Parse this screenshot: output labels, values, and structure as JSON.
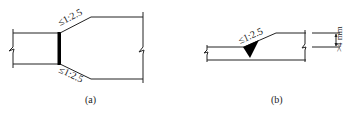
{
  "figures": [
    {
      "id": "a",
      "caption": "(a)",
      "slope_top": "≤1:2.5",
      "slope_bottom": "≤1:2.5"
    },
    {
      "id": "b",
      "caption": "(b)",
      "slope": "≤1:2.5",
      "dimension": ">4 mm"
    }
  ],
  "colors": {
    "line": "#222222",
    "weld": "#000000",
    "background": "#ffffff"
  }
}
